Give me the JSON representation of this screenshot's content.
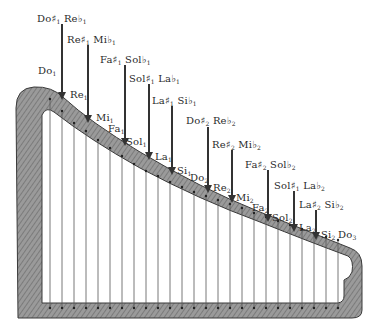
{
  "diagram": {
    "title": "",
    "colors": {
      "frame": "#8c8c8c",
      "frame_dark": "#5a5a5a",
      "string": "#555555",
      "arrow": "#333333",
      "text": "#2a2a2a"
    },
    "natural_notes": [
      {
        "name": "Do",
        "octave": "1",
        "x": 38,
        "y": 74
      },
      {
        "name": "Re",
        "octave": "1",
        "x": 70,
        "y": 98
      },
      {
        "name": "Mi",
        "octave": "1",
        "x": 96,
        "y": 121
      },
      {
        "name": "Fa",
        "octave": "1",
        "x": 108,
        "y": 132
      },
      {
        "name": "Sol",
        "octave": "1",
        "x": 126,
        "y": 145
      },
      {
        "name": "La",
        "octave": "1",
        "x": 155,
        "y": 160
      },
      {
        "name": "Si",
        "octave": "1",
        "x": 177,
        "y": 174
      },
      {
        "name": "Do",
        "octave": "2",
        "x": 190,
        "y": 181
      },
      {
        "name": "Re",
        "octave": "2",
        "x": 213,
        "y": 191
      },
      {
        "name": "Mi",
        "octave": "2",
        "x": 236,
        "y": 201
      },
      {
        "name": "Fa",
        "octave": "2",
        "x": 252,
        "y": 211
      },
      {
        "name": "Sol",
        "octave": "2",
        "x": 272,
        "y": 221
      },
      {
        "name": "La",
        "octave": "2",
        "x": 299,
        "y": 231
      },
      {
        "name": "Si",
        "octave": "2",
        "x": 321,
        "y": 238
      },
      {
        "name": "Do",
        "octave": "3",
        "x": 338,
        "y": 238
      }
    ],
    "accidentals": [
      {
        "sharp": "Do#",
        "sharp_octave": "1",
        "flat": "Reb",
        "flat_octave": "1",
        "label_x": 37,
        "label_y": 14,
        "arrow_x": 62,
        "arrow_top": 24,
        "arrow_bottom": 100
      },
      {
        "sharp": "Re#",
        "sharp_octave": "1",
        "flat": "Mib",
        "flat_octave": "1",
        "label_x": 67,
        "label_y": 35,
        "arrow_x": 88,
        "arrow_top": 45,
        "arrow_bottom": 123
      },
      {
        "sharp": "Fa#",
        "sharp_octave": "1",
        "flat": "Solb",
        "flat_octave": "1",
        "label_x": 100,
        "label_y": 55,
        "arrow_x": 125,
        "arrow_top": 65,
        "arrow_bottom": 146
      },
      {
        "sharp": "Sol#",
        "sharp_octave": "1",
        "flat": "Lab",
        "flat_octave": "1",
        "label_x": 129,
        "label_y": 74,
        "arrow_x": 149,
        "arrow_top": 84,
        "arrow_bottom": 160
      },
      {
        "sharp": "La#",
        "sharp_octave": "1",
        "flat": "Sib",
        "flat_octave": "1",
        "label_x": 152,
        "label_y": 96,
        "arrow_x": 172,
        "arrow_top": 106,
        "arrow_bottom": 175
      },
      {
        "sharp": "Do#",
        "sharp_octave": "2",
        "flat": "Reb",
        "flat_octave": "2",
        "label_x": 186,
        "label_y": 116,
        "arrow_x": 208,
        "arrow_top": 127,
        "arrow_bottom": 193
      },
      {
        "sharp": "Re#",
        "sharp_octave": "2",
        "flat": "Mib",
        "flat_octave": "2",
        "label_x": 212,
        "label_y": 140,
        "arrow_x": 232,
        "arrow_top": 150,
        "arrow_bottom": 203
      },
      {
        "sharp": "Fa#",
        "sharp_octave": "2",
        "flat": "Solb",
        "flat_octave": "2",
        "label_x": 245,
        "label_y": 160,
        "arrow_x": 268,
        "arrow_top": 170,
        "arrow_bottom": 222
      },
      {
        "sharp": "Sol#",
        "sharp_octave": "1",
        "flat": "Lab",
        "flat_octave": "2",
        "label_x": 274,
        "label_y": 181,
        "arrow_x": 294,
        "arrow_top": 191,
        "arrow_bottom": 232
      },
      {
        "sharp": "La#",
        "sharp_octave": "2",
        "flat": "Sib",
        "flat_octave": "2",
        "label_x": 299,
        "label_y": 200,
        "arrow_x": 316,
        "arrow_top": 210,
        "arrow_bottom": 240
      }
    ],
    "strings": {
      "count": 25,
      "x_start": 50,
      "spacing": 12,
      "bottom_y": 308,
      "top_y": [
        99,
        111,
        123,
        131,
        140,
        148,
        156,
        164,
        171,
        176,
        182,
        187,
        192,
        196,
        200,
        204,
        208,
        213,
        217,
        221,
        225,
        229,
        233,
        237,
        240
      ]
    }
  }
}
